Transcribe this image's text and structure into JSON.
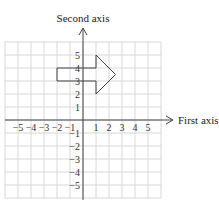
{
  "axes": {
    "x_label": "First axis",
    "y_label": "Second axis",
    "x_ticks": [
      -5,
      -4,
      -3,
      -2,
      -1,
      1,
      2,
      3,
      4,
      5
    ],
    "y_ticks": [
      5,
      4,
      3,
      2,
      1,
      -1,
      -2,
      -3,
      -4,
      -5
    ],
    "range": [
      -6,
      6
    ],
    "grid": true
  },
  "shape": {
    "name": "arrow",
    "points": [
      [
        -2,
        3
      ],
      [
        -2,
        4
      ],
      [
        1,
        4
      ],
      [
        1,
        5
      ],
      [
        2.5,
        3.5
      ],
      [
        1,
        2
      ],
      [
        1,
        3
      ]
    ]
  },
  "colors": {
    "grid": "#d8d8d8",
    "axis": "#444444",
    "shape": "#444444"
  }
}
